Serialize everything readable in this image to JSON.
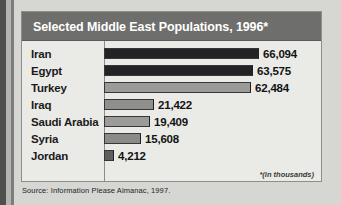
{
  "chart_data": {
    "type": "bar",
    "orientation": "horizontal",
    "title": "Selected Middle East Populations, 1996*",
    "footnote": "*(in thousands)",
    "source": "Source: Information Please Almanac, 1997.",
    "xlabel": "",
    "ylabel": "",
    "grid": false,
    "legend": "none",
    "xlim": [
      0,
      66094
    ],
    "categories": [
      "Iran",
      "Egypt",
      "Turkey",
      "Iraq",
      "Saudi Arabia",
      "Syria",
      "Jordan"
    ],
    "values": [
      66094,
      63575,
      62484,
      21422,
      19409,
      15608,
      4212
    ],
    "value_labels": [
      "66,094",
      "63,575",
      "62,484",
      "21,422",
      "19,409",
      "15,608",
      "4,212"
    ],
    "bar_colors": [
      "#232326",
      "#232326",
      "#9b9b99",
      "#8f8f8d",
      "#9b9b99",
      "#8a8a88",
      "#5f5f5d"
    ],
    "rows": [
      {
        "label": "Iran",
        "value": 66094,
        "value_label": "66,094",
        "color": "#232326"
      },
      {
        "label": "Egypt",
        "value": 63575,
        "value_label": "63,575",
        "color": "#232326"
      },
      {
        "label": "Turkey",
        "value": 62484,
        "value_label": "62,484",
        "color": "#9b9b99"
      },
      {
        "label": "Iraq",
        "value": 21422,
        "value_label": "21,422",
        "color": "#8f8f8d"
      },
      {
        "label": "Saudi Arabia",
        "value": 19409,
        "value_label": "19,409",
        "color": "#9b9b99"
      },
      {
        "label": "Syria",
        "value": 15608,
        "value_label": "15,608",
        "color": "#8a8a88"
      },
      {
        "label": "Jordan",
        "value": 4212,
        "value_label": "4,212",
        "color": "#5f5f5d"
      }
    ]
  },
  "figure": {
    "title": "Selected Middle East Populations, 1996*",
    "footnote": "*(in thousands)",
    "source": "Source: Information Please Almanac, 1997."
  },
  "colors": {
    "title_bar": "#6e6e6c",
    "plot_background": "#eaeae7",
    "page_background": "#d6d6d3",
    "frame": "#8e8e8c"
  }
}
